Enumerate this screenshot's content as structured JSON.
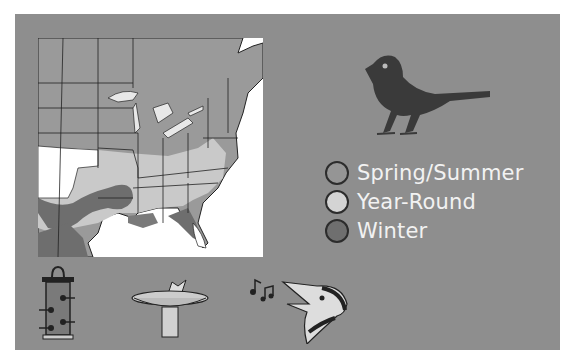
{
  "map": {
    "region": "Eastern United States",
    "colors": {
      "land": "#9a9a9a",
      "year_round": "#c9c9c9",
      "winter": "#6e6e6e",
      "out_of_range": "#ffffff",
      "border": "#222222"
    }
  },
  "species_icon": "songbird-silhouette-icon",
  "legend": {
    "items": [
      {
        "label": "Spring/Summer",
        "color": "#959595"
      },
      {
        "label": "Year-Round",
        "color": "#d4d4d4"
      },
      {
        "label": "Winter",
        "color": "#6f6f6f"
      }
    ]
  },
  "attractants": [
    {
      "icon": "tube-feeder-icon",
      "name": "Feeder"
    },
    {
      "icon": "birdbath-icon",
      "name": "Birdbath"
    },
    {
      "icon": "singing-bird-icon",
      "name": "Song"
    }
  ],
  "colors": {
    "panel": "#8e8e8e",
    "text": "#f2f2f2"
  }
}
